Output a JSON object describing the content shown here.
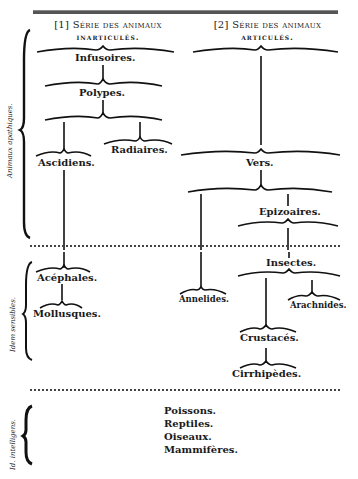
{
  "headers": {
    "left": {
      "line1": "[1] Série des animaux",
      "line2": "inarticulés."
    },
    "right": {
      "line1": "[2] Série des animaux",
      "line2": "articulés."
    }
  },
  "side_labels": {
    "apathiques": "Animaux apathiques.",
    "sensibles": "Idem sensibles.",
    "intelligens": "Id. intelligens."
  },
  "nodes": {
    "infusoires": "Infusoires.",
    "polypes": "Polypes.",
    "ascidiens": "Ascidiens.",
    "radiaires": "Radiaires.",
    "vers": "Vers.",
    "epizoaires": "Epizoaires.",
    "acephales": "Acéphales.",
    "mollusques": "Mollusques.",
    "annelides": "Annelides.",
    "insectes": "Insectes.",
    "arachnides": "Arachnides.",
    "crustaces": "Crustacés.",
    "cirrhipedes": "Cirrhipèdes."
  },
  "vertebrates": [
    "Poissons.",
    "Reptiles.",
    "Oiseaux.",
    "Mammifères."
  ]
}
